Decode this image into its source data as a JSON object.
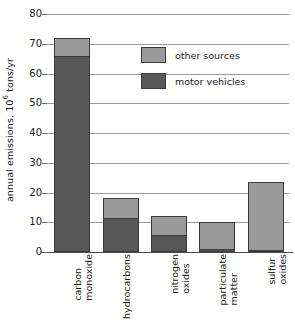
{
  "chart_data": {
    "type": "bar",
    "subtype": "stacked-vertical",
    "title": "",
    "xlabel": "",
    "ylabel": "annual emissions, 10^6 tons/yr",
    "ylabel_prefix": "annual emissions, 10",
    "ylabel_exponent": "6",
    "ylabel_suffix": " tons/yr",
    "ylim": [
      0,
      80
    ],
    "ytick_values": [
      0,
      10,
      20,
      30,
      40,
      50,
      60,
      70,
      80
    ],
    "ytick_labels": [
      "0",
      "10",
      "20",
      "30",
      "40",
      "50",
      "60",
      "70",
      "80"
    ],
    "grid": true,
    "grid_axis": "y",
    "legend_position": "upper-right-inside",
    "categories": [
      "carbon monoxide",
      "hydrocarbons",
      "nitrogen oxides",
      "particulate matter",
      "sulfur oxides"
    ],
    "category_lines": [
      [
        "carbon",
        "monoxide"
      ],
      [
        "hydrocarbons",
        ""
      ],
      [
        "nitrogen",
        "oxides"
      ],
      [
        "particulate",
        "matter"
      ],
      [
        "sulfur",
        "oxides"
      ]
    ],
    "series": [
      {
        "name": "motor vehicles",
        "color": "#575757",
        "values": [
          66.0,
          11.6,
          5.8,
          1.0,
          0.8
        ]
      },
      {
        "name": "other sources",
        "color": "#9a9a9a",
        "values": [
          6.0,
          6.7,
          6.2,
          9.2,
          22.7
        ]
      }
    ],
    "totals": [
      72.0,
      18.3,
      12.0,
      10.2,
      23.5
    ]
  },
  "legend": {
    "items": [
      {
        "label": "other sources",
        "color": "#9a9a9a",
        "swatch": "legend-swatch-other-sources"
      },
      {
        "label": "motor vehicles",
        "color": "#575757",
        "swatch": "legend-swatch-motor-vehicles"
      }
    ]
  },
  "axis": {
    "y_title_prefix": "annual emissions, 10",
    "y_title_exponent": "6",
    "y_title_suffix": " tons/yr",
    "ticks": [
      "80",
      "70",
      "60",
      "50",
      "40",
      "30",
      "20",
      "10",
      "0"
    ]
  },
  "colors": {
    "other_sources": "#9a9a9a",
    "motor_vehicles": "#575757",
    "gridline": "#9b9b9b",
    "axis": "#4a4a4a",
    "bar_outline": "#3c3c3c",
    "text": "#1a1a1a",
    "background": "#ffffff"
  }
}
